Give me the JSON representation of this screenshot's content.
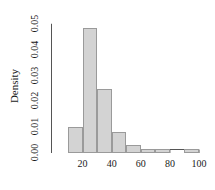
{
  "chart_data": {
    "type": "bar",
    "chart_style": "histogram",
    "title": "",
    "subtitle": "",
    "xlabel": "",
    "ylabel": "Density",
    "xlim": [
      10,
      100
    ],
    "ylim": [
      0.0,
      0.05
    ],
    "grid": false,
    "legend": null,
    "bin_width": 10,
    "bin_edges": [
      10,
      20,
      30,
      40,
      50,
      60,
      70,
      80,
      90,
      100
    ],
    "categories": [
      "10-20",
      "20-30",
      "30-40",
      "40-50",
      "50-60",
      "60-70",
      "70-80",
      "80-90",
      "90-100"
    ],
    "values": [
      0.01,
      0.0485,
      0.025,
      0.008,
      0.003,
      0.0015,
      0.0015,
      0.0,
      0.0015
    ],
    "x_ticks": [
      20,
      40,
      60,
      80,
      100
    ],
    "x_tick_labels": [
      "20",
      "40",
      "60",
      "80",
      "100"
    ],
    "y_ticks": [
      0.0,
      0.01,
      0.02,
      0.03,
      0.04,
      0.05
    ],
    "y_tick_labels": [
      "0.00",
      "0.01",
      "0.02",
      "0.03",
      "0.04",
      "0.05"
    ],
    "bar_fill_color": "#d3d3d3",
    "bar_border_color": "#9a9a9a",
    "axis_color": "#555555",
    "text_color": "#1a1a1a",
    "background_color": "#ffffff"
  }
}
